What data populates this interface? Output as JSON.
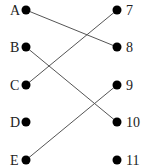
{
  "diagram": {
    "type": "matching",
    "left": [
      {
        "label": "A",
        "y": 10
      },
      {
        "label": "B",
        "y": 47
      },
      {
        "label": "C",
        "y": 85
      },
      {
        "label": "D",
        "y": 122
      },
      {
        "label": "E",
        "y": 160
      }
    ],
    "right": [
      {
        "label": "7",
        "y": 10
      },
      {
        "label": "8",
        "y": 47
      },
      {
        "label": "9",
        "y": 85
      },
      {
        "label": "10",
        "y": 122
      },
      {
        "label": "11",
        "y": 160
      }
    ],
    "connections": [
      {
        "from": "A",
        "to": "8"
      },
      {
        "from": "B",
        "to": "10"
      },
      {
        "from": "C",
        "to": "7"
      },
      {
        "from": "E",
        "to": "9"
      }
    ],
    "colors": {
      "dot": "#000000",
      "line": "#555555",
      "text": "#222222"
    }
  }
}
